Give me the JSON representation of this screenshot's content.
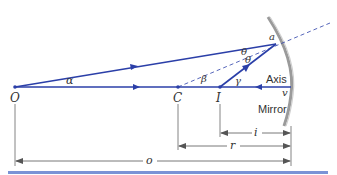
{
  "diagram": {
    "colors": {
      "ray": "#2b3fa8",
      "dashed": "#2b3fa8",
      "mirror": "#8a8a8a",
      "dimension": "#555555",
      "bottom_rule": "#7a93d6"
    },
    "points": {
      "O": "O",
      "C": "C",
      "I": "I",
      "v": "v",
      "a": "a"
    },
    "angles": {
      "alpha": "α",
      "beta": "β",
      "gamma": "γ",
      "theta_incident": "θ",
      "theta_reflected": "θ"
    },
    "labels": {
      "axis": "Axis",
      "mirror": "Mirror"
    },
    "dimensions": {
      "i": "i",
      "r": "r",
      "o": "o"
    }
  }
}
